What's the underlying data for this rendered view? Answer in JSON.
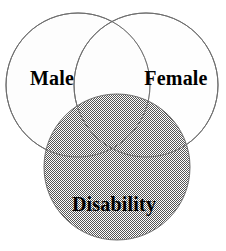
{
  "figure": {
    "type": "venn-diagram",
    "background_color": "#ffffff",
    "outline_color": "#6e6e6e",
    "label_color": "#000000",
    "shaded_fill_color": "#9a9a9a",
    "unshaded_fill_color": "#fdfdfd"
  },
  "chart_data": {
    "type": "diagram",
    "title": "",
    "sets": [
      {
        "id": "male",
        "label": "Male",
        "cx": 78,
        "cy": 85,
        "r": 72,
        "fill": "plain",
        "fill_color": "#fdfdfd",
        "label_x": 52,
        "label_y": 78
      },
      {
        "id": "female",
        "label": "Female",
        "cx": 146,
        "cy": 85,
        "r": 72,
        "fill": "plain",
        "fill_color": "#fdfdfd",
        "label_x": 176,
        "label_y": 78
      },
      {
        "id": "disability",
        "label": "Disability",
        "cx": 117,
        "cy": 167,
        "r": 73,
        "fill": "checkerboard-dither",
        "fill_color": "#9a9a9a",
        "label_x": 114,
        "label_y": 204
      }
    ],
    "legend": [],
    "annotations": []
  },
  "labels": {
    "male": "Male",
    "female": "Female",
    "disability": "Disability"
  }
}
